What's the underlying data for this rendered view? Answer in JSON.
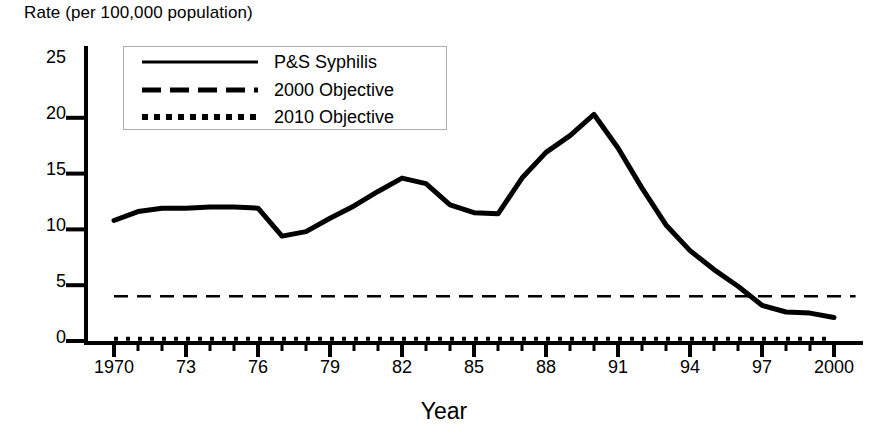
{
  "chart_data": {
    "type": "line",
    "title": "Rate (per 100,000 population)",
    "ylabel": "Rate (per 100,000 population)",
    "xlabel": "Year",
    "xlim": [
      1970,
      2000
    ],
    "ylim": [
      0,
      25
    ],
    "grid": false,
    "legend_position": "top-left-inside",
    "y_ticks": [
      "0",
      "5",
      "10",
      "15",
      "20",
      "25"
    ],
    "y_tick_values": [
      0,
      5,
      10,
      15,
      20,
      25
    ],
    "x_ticks": [
      "1970",
      "73",
      "76",
      "79",
      "82",
      "85",
      "88",
      "91",
      "94",
      "97",
      "2000"
    ],
    "x_tick_values": [
      1970,
      1973,
      1976,
      1979,
      1982,
      1985,
      1988,
      1991,
      1994,
      1997,
      2000
    ],
    "x_minor_tick_interval": 1,
    "x": [
      1970,
      1971,
      1972,
      1973,
      1974,
      1975,
      1976,
      1977,
      1978,
      1979,
      1980,
      1981,
      1982,
      1983,
      1984,
      1985,
      1986,
      1987,
      1988,
      1989,
      1990,
      1991,
      1992,
      1993,
      1994,
      1995,
      1996,
      1997,
      1998,
      1999,
      2000
    ],
    "series": [
      {
        "name": "P&S Syphilis",
        "style": "solid",
        "color": "#000000",
        "values": [
          10.8,
          11.6,
          11.9,
          11.9,
          12.0,
          12.0,
          11.9,
          9.4,
          9.8,
          11.0,
          12.1,
          13.4,
          14.6,
          14.1,
          12.2,
          11.5,
          11.4,
          14.6,
          16.9,
          18.4,
          20.3,
          17.3,
          13.7,
          10.4,
          8.1,
          6.4,
          4.9,
          3.2,
          2.6,
          2.5,
          2.1
        ]
      },
      {
        "name": "2000 Objective",
        "style": "dashed",
        "color": "#000000",
        "constant_value": 4.0
      },
      {
        "name": "2010 Objective",
        "style": "dotted",
        "color": "#000000",
        "constant_value": 0.2
      }
    ]
  },
  "legend": {
    "items": [
      {
        "label": "P&S Syphilis",
        "style": "solid"
      },
      {
        "label": "2000 Objective",
        "style": "dashed"
      },
      {
        "label": "2010 Objective",
        "style": "dotted"
      }
    ]
  },
  "axes": {
    "y_title": "Rate (per 100,000 population)",
    "x_title": "Year",
    "y_tick_labels": [
      "25",
      "20",
      "15",
      "10",
      "5",
      "0"
    ],
    "x_tick_labels": [
      "1970",
      "73",
      "76",
      "79",
      "82",
      "85",
      "88",
      "91",
      "94",
      "97",
      "2000"
    ]
  }
}
